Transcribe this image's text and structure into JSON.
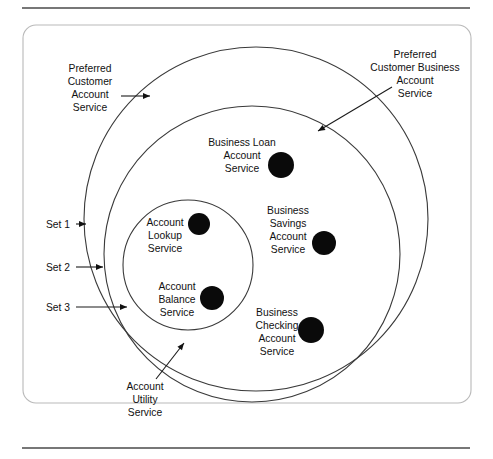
{
  "figure": {
    "type": "venn-set-diagram",
    "frame": {
      "x": 23,
      "y": 25,
      "width": 448,
      "height": 378,
      "corner_radius": 13
    },
    "rules": [
      {
        "name": "top-rule",
        "x1": 22,
        "y1": 8,
        "x2": 470,
        "y2": 8
      },
      {
        "name": "bottom-rule",
        "x1": 22,
        "y1": 448,
        "x2": 470,
        "y2": 448
      }
    ],
    "sets": [
      {
        "id": "set1",
        "set_label": "Set 1",
        "name_label": "Preferred\nCustomer\nAccount\nService",
        "name_lines": [
          "Preferred",
          "Customer",
          "Account",
          "Service"
        ],
        "cx": 256,
        "cy": 219,
        "r": 172
      },
      {
        "id": "set2",
        "set_label": "Set 2",
        "name_label": "Preferred Customer Business Account Service",
        "name_lines": [
          "Preferred",
          "Customer Business",
          "Account",
          "Service"
        ],
        "cx": 252,
        "cy": 254,
        "r": 148
      },
      {
        "id": "set3",
        "set_label": "Set 3",
        "name_label": "Account Utility Service",
        "name_lines": [
          "Account",
          "Utility",
          "Service"
        ],
        "cx": 188,
        "cy": 265,
        "r": 65
      }
    ],
    "set_labels": [
      {
        "id": "set1",
        "text": "Set 1",
        "text_x": 70,
        "text_y": 228,
        "line_x1": 76,
        "line_y1": 224,
        "line_x2": 86,
        "line_y2": 224
      },
      {
        "id": "set2",
        "text": "Set 2",
        "text_x": 70,
        "text_y": 271,
        "line_x1": 76,
        "line_y1": 267,
        "line_x2": 103,
        "line_y2": 267
      },
      {
        "id": "set3",
        "text": "Set 3",
        "text_x": 70,
        "text_y": 311,
        "line_x1": 76,
        "line_y1": 307,
        "line_x2": 127,
        "line_y2": 307
      }
    ],
    "callouts": [
      {
        "id": "preferred-customer-account-service",
        "lines": [
          "Preferred",
          "Customer",
          "Account",
          "Service"
        ],
        "text_x": 90,
        "text_y": 72,
        "align": "middle",
        "line_x1": 121,
        "line_y1": 96,
        "line_x2": 150,
        "line_y2": 96
      },
      {
        "id": "preferred-customer-business-account-service",
        "lines": [
          "Preferred",
          "Customer Business",
          "Account",
          "Service"
        ],
        "text_x": 415,
        "text_y": 58,
        "align": "middle",
        "line_x1": 392,
        "line_y1": 87,
        "line_x2": 318,
        "line_y2": 131
      },
      {
        "id": "account-utility-service",
        "lines": [
          "Account",
          "Utility",
          "Service"
        ],
        "text_x": 145,
        "text_y": 390,
        "align": "middle",
        "line_x1": 156,
        "line_y1": 379,
        "line_x2": 184,
        "line_y2": 343
      }
    ],
    "services": [
      {
        "id": "business-loan-account-service",
        "lines": [
          "Business Loan",
          "Account",
          "Service"
        ],
        "text_x": 242,
        "text_y": 146,
        "align": "middle",
        "dot_cx": 281,
        "dot_cy": 165,
        "dot_r": 13,
        "member_of": "set2"
      },
      {
        "id": "account-lookup-service",
        "lines": [
          "Account",
          "Lookup",
          "Service"
        ],
        "text_x": 165,
        "text_y": 226,
        "align": "middle",
        "dot_cx": 199,
        "dot_cy": 224,
        "dot_r": 11,
        "member_of": "set3"
      },
      {
        "id": "business-savings-account-service",
        "lines": [
          "Business",
          "Savings",
          "Account",
          "Service"
        ],
        "text_x": 288,
        "text_y": 214,
        "align": "middle",
        "dot_cx": 324,
        "dot_cy": 243,
        "dot_r": 12,
        "member_of": "set2"
      },
      {
        "id": "account-balance-service",
        "lines": [
          "Account",
          "Balance",
          "Service"
        ],
        "text_x": 177,
        "text_y": 290,
        "align": "middle",
        "dot_cx": 212,
        "dot_cy": 298,
        "dot_r": 12,
        "member_of": "set3"
      },
      {
        "id": "business-checking-account-service",
        "lines": [
          "Business",
          "Checking",
          "Account",
          "Service"
        ],
        "text_x": 277,
        "text_y": 316,
        "align": "middle",
        "dot_cx": 311,
        "dot_cy": 330,
        "dot_r": 13,
        "member_of": "set2"
      }
    ],
    "colors": {
      "dot": "#0a0a0a",
      "circle_stroke": "#3a3a3a",
      "frame_stroke": "#b9b9b9",
      "rule_stroke": "#4a4a4a",
      "text": "#111111",
      "background": "#ffffff"
    },
    "line_height": 13
  }
}
